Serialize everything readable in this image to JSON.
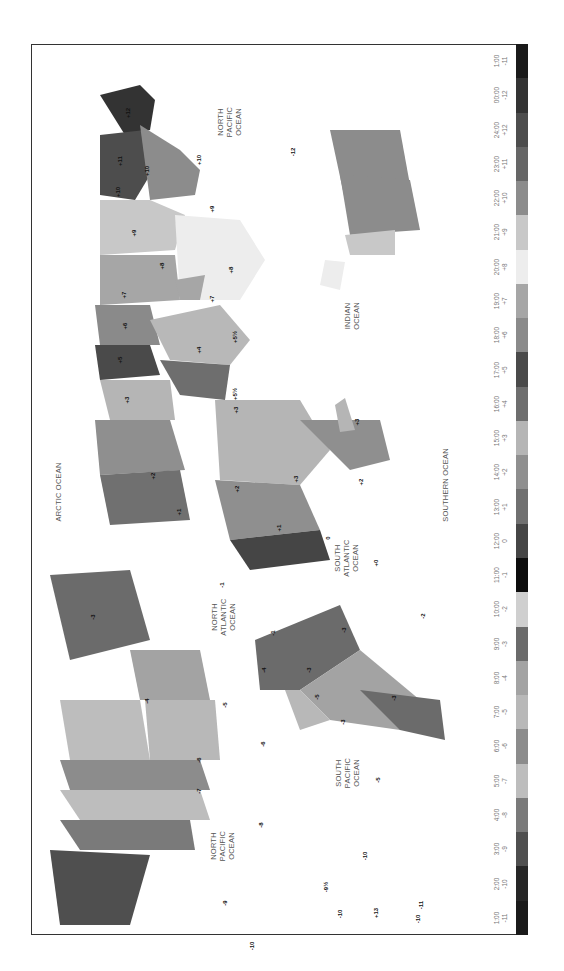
{
  "map": {
    "title": "World Time Zones",
    "orientation": "rotated-90-clockwise"
  },
  "legend": {
    "items": [
      {
        "time": "1:00",
        "offset": "-11",
        "color": "#1a1a1a"
      },
      {
        "time": "00:00",
        "offset": "-12",
        "color": "#333333"
      },
      {
        "time": "24:00",
        "offset": "+12",
        "color": "#4d4d4d"
      },
      {
        "time": "23:00",
        "offset": "+11",
        "color": "#666666"
      },
      {
        "time": "22:00",
        "offset": "+10",
        "color": "#8c8c8c"
      },
      {
        "time": "21:00",
        "offset": "+9",
        "color": "#c8c8c8"
      },
      {
        "time": "20:00",
        "offset": "+8",
        "color": "#ededed"
      },
      {
        "time": "19:00",
        "offset": "+7",
        "color": "#a6a6a6"
      },
      {
        "time": "18:00",
        "offset": "+6",
        "color": "#8a8a8a"
      },
      {
        "time": "17:00",
        "offset": "+5",
        "color": "#4a4a4a"
      },
      {
        "time": "16:00",
        "offset": "+4",
        "color": "#6e6e6e"
      },
      {
        "time": "15:00",
        "offset": "+3",
        "color": "#b5b5b5"
      },
      {
        "time": "14:00",
        "offset": "+2",
        "color": "#8f8f8f"
      },
      {
        "time": "13:00",
        "offset": "+1",
        "color": "#707070"
      },
      {
        "time": "12:00",
        "offset": "0",
        "color": "#454545"
      },
      {
        "time": "11:00",
        "offset": "-1",
        "color": "#0d0d0d"
      },
      {
        "time": "10:00",
        "offset": "-2",
        "color": "#cfcfcf"
      },
      {
        "time": "9:00",
        "offset": "-3",
        "color": "#6b6b6b"
      },
      {
        "time": "8:00",
        "offset": "-4",
        "color": "#a3a3a3"
      },
      {
        "time": "7:00",
        "offset": "-5",
        "color": "#b8b8b8"
      },
      {
        "time": "6:00",
        "offset": "-6",
        "color": "#8c8c8c"
      },
      {
        "time": "5:00",
        "offset": "-7",
        "color": "#bdbdbd"
      },
      {
        "time": "4:00",
        "offset": "-8",
        "color": "#7a7a7a"
      },
      {
        "time": "3:00",
        "offset": "-9",
        "color": "#4f4f4f"
      },
      {
        "time": "2:00",
        "offset": "-10",
        "color": "#262626"
      },
      {
        "time": "1:00",
        "offset": "-11",
        "color": "#1a1a1a"
      }
    ]
  },
  "oceans": [
    {
      "name": "NORTH\nPACIFIC\nOCEAN",
      "x": 229,
      "y": 122
    },
    {
      "name": "ARCTIC OCEAN",
      "x": 58,
      "y": 492
    },
    {
      "name": "INDIAN\nOCEAN",
      "x": 352,
      "y": 316
    },
    {
      "name": "SOUTHERN OCEAN",
      "x": 445,
      "y": 485
    },
    {
      "name": "SOUTH\nATLANTIC\nOCEAN",
      "x": 346,
      "y": 558
    },
    {
      "name": "NORTH\nATLANTIC\nOCEAN",
      "x": 223,
      "y": 617
    },
    {
      "name": "SOUTH\nPACIFIC\nOCEAN",
      "x": 347,
      "y": 773
    },
    {
      "name": "NORTH\nPACIFIC\nOCEAN",
      "x": 222,
      "y": 846
    }
  ],
  "zone_labels": [
    {
      "text": "+12",
      "x": 128,
      "y": 113
    },
    {
      "text": "+11",
      "x": 120,
      "y": 161
    },
    {
      "text": "+10",
      "x": 147,
      "y": 171
    },
    {
      "text": "+10",
      "x": 118,
      "y": 192
    },
    {
      "text": "+10",
      "x": 199,
      "y": 160
    },
    {
      "text": "+9",
      "x": 212,
      "y": 209
    },
    {
      "text": "+9",
      "x": 134,
      "y": 233
    },
    {
      "text": "+8",
      "x": 162,
      "y": 266
    },
    {
      "text": "+8",
      "x": 231,
      "y": 270
    },
    {
      "text": "+7",
      "x": 124,
      "y": 295
    },
    {
      "text": "+7",
      "x": 212,
      "y": 299
    },
    {
      "text": "+6",
      "x": 125,
      "y": 326
    },
    {
      "text": "+5",
      "x": 120,
      "y": 360
    },
    {
      "text": "+5½",
      "x": 235,
      "y": 337
    },
    {
      "text": "+5½",
      "x": 235,
      "y": 394
    },
    {
      "text": "+4",
      "x": 199,
      "y": 350
    },
    {
      "text": "+3",
      "x": 127,
      "y": 400
    },
    {
      "text": "+3",
      "x": 236,
      "y": 410
    },
    {
      "text": "+3",
      "x": 296,
      "y": 479
    },
    {
      "text": "+3",
      "x": 357,
      "y": 422
    },
    {
      "text": "+2",
      "x": 153,
      "y": 476
    },
    {
      "text": "+2",
      "x": 237,
      "y": 489
    },
    {
      "text": "+2",
      "x": 361,
      "y": 482
    },
    {
      "text": "+1",
      "x": 179,
      "y": 512
    },
    {
      "text": "+1",
      "x": 279,
      "y": 528
    },
    {
      "text": "0",
      "x": 328,
      "y": 538
    },
    {
      "text": "+0",
      "x": 376,
      "y": 563
    },
    {
      "text": "-1",
      "x": 222,
      "y": 585
    },
    {
      "text": "-1",
      "x": 273,
      "y": 633
    },
    {
      "text": "-3",
      "x": 93,
      "y": 617
    },
    {
      "text": "-3",
      "x": 344,
      "y": 630
    },
    {
      "text": "-3",
      "x": 309,
      "y": 670
    },
    {
      "text": "-3",
      "x": 394,
      "y": 698
    },
    {
      "text": "-3",
      "x": 343,
      "y": 722
    },
    {
      "text": "-2",
      "x": 423,
      "y": 616
    },
    {
      "text": "-4",
      "x": 147,
      "y": 701
    },
    {
      "text": "-4",
      "x": 264,
      "y": 670
    },
    {
      "text": "-5",
      "x": 225,
      "y": 705
    },
    {
      "text": "-5",
      "x": 317,
      "y": 697
    },
    {
      "text": "-5",
      "x": 378,
      "y": 780
    },
    {
      "text": "-6",
      "x": 263,
      "y": 744
    },
    {
      "text": "-6",
      "x": 199,
      "y": 760
    },
    {
      "text": "-7",
      "x": 199,
      "y": 791
    },
    {
      "text": "-8",
      "x": 261,
      "y": 825
    },
    {
      "text": "-9",
      "x": 225,
      "y": 903
    },
    {
      "text": "-9½",
      "x": 326,
      "y": 887
    },
    {
      "text": "-10",
      "x": 365,
      "y": 856
    },
    {
      "text": "-10",
      "x": 252,
      "y": 946
    },
    {
      "text": "-10",
      "x": 340,
      "y": 914
    },
    {
      "text": "-10",
      "x": 418,
      "y": 919
    },
    {
      "text": "-11",
      "x": 421,
      "y": 905
    },
    {
      "text": "+13",
      "x": 376,
      "y": 913
    },
    {
      "text": "-12",
      "x": 293,
      "y": 152
    }
  ]
}
